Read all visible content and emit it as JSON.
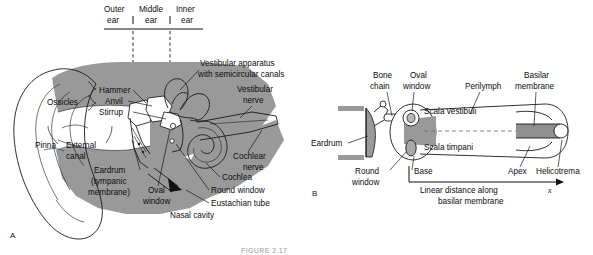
{
  "figure": {
    "caption": "FIGURE 2.17",
    "background_color": "#ffffff",
    "ink_color": "#1a1a1a",
    "tissue_gray": "#999999",
    "membrane_gray": "#8f8f8f"
  },
  "panel_a": {
    "letter": "A",
    "region_header": {
      "columns": [
        {
          "line1": "Outer",
          "line2": "ear"
        },
        {
          "line1": "Middle",
          "line2": "ear"
        },
        {
          "line1": "Inner",
          "line2": "ear"
        }
      ]
    },
    "labels": {
      "ossicles": "Ossicles",
      "hammer": "Hammer",
      "anvil": "Anvil",
      "stirrup": "Stirrup",
      "pinna": "Pinna",
      "external_canal_line1": "External",
      "external_canal_line2": "canal",
      "eardrum_line1": "Eardrum",
      "eardrum_line2": "(tympanic",
      "eardrum_line3": "membrane)",
      "oval_window_line1": "Oval",
      "oval_window_line2": "window",
      "nasal_cavity": "Nasal cavity",
      "eustachian_tube": "Eustachian tube",
      "round_window": "Round window",
      "cochlea": "Cochlea",
      "cochlear_nerve_line1": "Cochlear",
      "cochlear_nerve_line2": "nerve",
      "vestibular_nerve_line1": "Vestibular",
      "vestibular_nerve_line2": "nerve",
      "vestibular_apparatus_line1": "Vestibular apparatus",
      "vestibular_apparatus_line2": "with semicircular canals"
    }
  },
  "panel_b": {
    "letter": "B",
    "labels": {
      "bone_chain_line1": "Bone",
      "bone_chain_line2": "chain",
      "oval_window_line1": "Oval",
      "oval_window_line2": "window",
      "perilymph": "Perilymph",
      "basilar_membrane_line1": "Basilar",
      "basilar_membrane_line2": "membrane",
      "scala_vestibuli": "Scala vestibuli",
      "scala_timpani": "Scala timpani",
      "eardrum": "Eardrum",
      "round_window_line1": "Round",
      "round_window_line2": "window",
      "base": "Base",
      "apex": "Apex",
      "helicotrema": "Helicotrema",
      "axis_line1": "Linear distance along",
      "axis_line2": "basilar membrane",
      "axis_symbol": "x"
    }
  }
}
